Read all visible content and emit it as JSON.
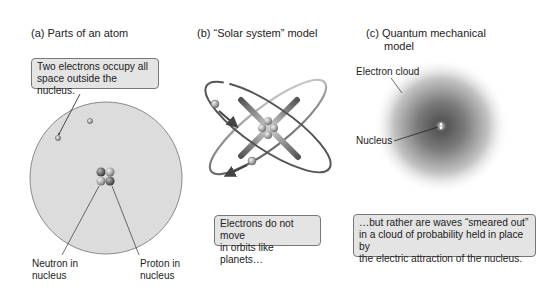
{
  "panels": [
    {
      "id": "a",
      "title": "(a)  Parts of an atom",
      "callout": [
        "Two electrons occupy all",
        "space outside the nucleus."
      ],
      "labels": {
        "neutron": [
          "Neutron in",
          "nucleus"
        ],
        "proton": [
          "Proton in",
          "nucleus"
        ]
      }
    },
    {
      "id": "b",
      "title": "(b)  “Solar system” model",
      "callout": [
        "Electrons do not move",
        "in orbits like planets…"
      ]
    },
    {
      "id": "c",
      "title_lines": [
        "(c)  Quantum mechanical",
        "model"
      ],
      "labels": {
        "cloud": "Electron cloud",
        "nucleus": "Nucleus"
      },
      "callout": [
        "…but rather are waves “smeared out”",
        "in a cloud of probability held in place by",
        "the electric attraction of the nucleus."
      ]
    }
  ],
  "colors": {
    "atom_fill": "#dcdcdc",
    "atom_stroke": "#888888",
    "callout_bg": "#e4e4e4",
    "callout_border": "#777777",
    "orbit": "#555555",
    "cloud_center": "#555555"
  }
}
